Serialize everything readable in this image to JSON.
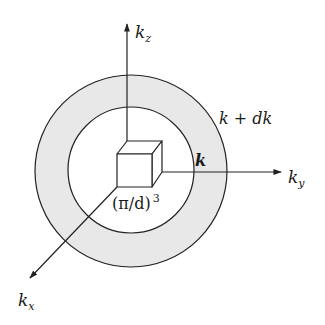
{
  "diagram": {
    "title": "",
    "colors": {
      "background": "#ffffff",
      "line": "#222222",
      "shell_fill": "#e8e8e8"
    },
    "axes": {
      "kz": {
        "label": "k",
        "subscript": "z"
      },
      "ky": {
        "label": "k",
        "subscript": "y"
      },
      "kx": {
        "label": "k",
        "subscript": "x"
      }
    },
    "spheres": {
      "inner_label": "k",
      "outer_label": "k + dk"
    },
    "cube": {
      "label_main": "(π/d)",
      "label_exp": "3"
    }
  }
}
